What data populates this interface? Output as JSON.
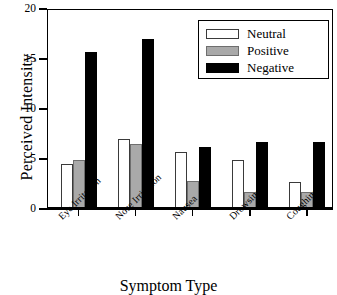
{
  "chart_data": {
    "type": "bar",
    "title": "",
    "xlabel": "Symptom Type",
    "ylabel": "Perceived Intensity",
    "categories": [
      "Eye Irritation",
      "Nose Irritation",
      "Nausea",
      "Drowsiness",
      "Coughing"
    ],
    "series": [
      {
        "name": "Neutral",
        "color": "#ffffff",
        "values": [
          4.5,
          7.0,
          5.7,
          4.9,
          2.7
        ]
      },
      {
        "name": "Positive",
        "color": "#a9a9a9",
        "values": [
          4.9,
          6.5,
          2.8,
          1.7,
          1.7
        ]
      },
      {
        "name": "Negative",
        "color": "#000000",
        "values": [
          15.7,
          17.0,
          6.2,
          6.7,
          6.7
        ]
      }
    ],
    "ylim": [
      0,
      20
    ],
    "yticks": [
      0,
      5,
      10,
      15,
      20
    ],
    "ytick_labels": [
      "0",
      "5",
      "10",
      "15",
      "20"
    ],
    "grid": false,
    "legend_position": "top-right"
  },
  "axes": {
    "y_title": "Perceived Intensity",
    "x_title": "Symptom Type",
    "y_tick_0": "0",
    "y_tick_1": "5",
    "y_tick_2": "10",
    "y_tick_3": "15",
    "y_tick_4": "20"
  },
  "legend": {
    "entries": [
      {
        "label": "Neutral"
      },
      {
        "label": "Positive"
      },
      {
        "label": "Negative"
      }
    ]
  },
  "xlabels": [
    {
      "text": "Eye Irritation"
    },
    {
      "text": "Nose Irritation"
    },
    {
      "text": "Nausea"
    },
    {
      "text": "Drowsiness"
    },
    {
      "text": "Coughing"
    }
  ]
}
